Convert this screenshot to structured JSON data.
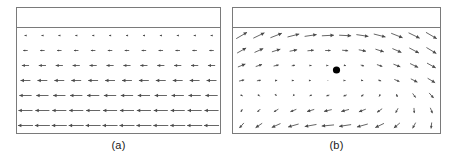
{
  "figure": {
    "background_color": "#ffffff",
    "border_color": "#7a7a7a",
    "arrow_color": "#4a4a4a",
    "marker_color": "#000000"
  },
  "panels": [
    {
      "id": "a",
      "caption": "(a)",
      "header_strip_height": 20,
      "marker": null
    },
    {
      "id": "b",
      "caption": "(b)",
      "header_strip_height": 20,
      "marker": {
        "x": 0.5,
        "y": 0.4,
        "radius": 3.6
      }
    }
  ],
  "chart_data": [
    {
      "type": "quiver",
      "panel": "a",
      "title": "(a)",
      "xlabel": "",
      "ylabel": "",
      "grid": false,
      "legend": null,
      "xlim": [
        0,
        12
      ],
      "ylim": [
        0,
        6
      ],
      "description": "Uniform leftward horizontal vector field; arrow magnitude increases monotonically from top row to bottom row.",
      "columns": 12,
      "rows": 7,
      "row_magnitudes": [
        0.12,
        0.3,
        0.48,
        0.66,
        0.82,
        0.94,
        1.0
      ],
      "row_angles_deg": [
        180,
        180,
        180,
        180,
        180,
        180,
        180
      ],
      "vectors": [
        {
          "x": 0,
          "y": 0,
          "u": -0.12,
          "v": 0
        },
        {
          "x": 1,
          "y": 0,
          "u": -0.12,
          "v": 0
        },
        {
          "x": 2,
          "y": 0,
          "u": -0.12,
          "v": 0
        },
        {
          "x": 3,
          "y": 0,
          "u": -0.12,
          "v": 0
        },
        {
          "x": 4,
          "y": 0,
          "u": -0.12,
          "v": 0
        },
        {
          "x": 5,
          "y": 0,
          "u": -0.12,
          "v": 0
        },
        {
          "x": 6,
          "y": 0,
          "u": -0.12,
          "v": 0
        },
        {
          "x": 7,
          "y": 0,
          "u": -0.12,
          "v": 0
        },
        {
          "x": 8,
          "y": 0,
          "u": -0.12,
          "v": 0
        },
        {
          "x": 9,
          "y": 0,
          "u": -0.12,
          "v": 0
        },
        {
          "x": 10,
          "y": 0,
          "u": -0.12,
          "v": 0
        },
        {
          "x": 11,
          "y": 0,
          "u": -0.12,
          "v": 0
        },
        {
          "x": 0,
          "y": 1,
          "u": -0.3,
          "v": 0
        },
        {
          "x": 1,
          "y": 1,
          "u": -0.3,
          "v": 0
        },
        {
          "x": 2,
          "y": 1,
          "u": -0.3,
          "v": 0
        },
        {
          "x": 3,
          "y": 1,
          "u": -0.3,
          "v": 0
        },
        {
          "x": 4,
          "y": 1,
          "u": -0.3,
          "v": 0
        },
        {
          "x": 5,
          "y": 1,
          "u": -0.3,
          "v": 0
        },
        {
          "x": 6,
          "y": 1,
          "u": -0.3,
          "v": 0
        },
        {
          "x": 7,
          "y": 1,
          "u": -0.3,
          "v": 0
        },
        {
          "x": 8,
          "y": 1,
          "u": -0.3,
          "v": 0
        },
        {
          "x": 9,
          "y": 1,
          "u": -0.3,
          "v": 0
        },
        {
          "x": 10,
          "y": 1,
          "u": -0.3,
          "v": 0
        },
        {
          "x": 11,
          "y": 1,
          "u": -0.3,
          "v": 0
        },
        {
          "x": 0,
          "y": 2,
          "u": -0.48,
          "v": 0
        },
        {
          "x": 1,
          "y": 2,
          "u": -0.48,
          "v": 0
        },
        {
          "x": 2,
          "y": 2,
          "u": -0.48,
          "v": 0
        },
        {
          "x": 3,
          "y": 2,
          "u": -0.48,
          "v": 0
        },
        {
          "x": 4,
          "y": 2,
          "u": -0.48,
          "v": 0
        },
        {
          "x": 5,
          "y": 2,
          "u": -0.48,
          "v": 0
        },
        {
          "x": 6,
          "y": 2,
          "u": -0.48,
          "v": 0
        },
        {
          "x": 7,
          "y": 2,
          "u": -0.48,
          "v": 0
        },
        {
          "x": 8,
          "y": 2,
          "u": -0.48,
          "v": 0
        },
        {
          "x": 9,
          "y": 2,
          "u": -0.48,
          "v": 0
        },
        {
          "x": 10,
          "y": 2,
          "u": -0.48,
          "v": 0
        },
        {
          "x": 11,
          "y": 2,
          "u": -0.48,
          "v": 0
        },
        {
          "x": 0,
          "y": 3,
          "u": -0.66,
          "v": 0
        },
        {
          "x": 1,
          "y": 3,
          "u": -0.66,
          "v": 0
        },
        {
          "x": 2,
          "y": 3,
          "u": -0.66,
          "v": 0
        },
        {
          "x": 3,
          "y": 3,
          "u": -0.66,
          "v": 0
        },
        {
          "x": 4,
          "y": 3,
          "u": -0.66,
          "v": 0
        },
        {
          "x": 5,
          "y": 3,
          "u": -0.66,
          "v": 0
        },
        {
          "x": 6,
          "y": 3,
          "u": -0.66,
          "v": 0
        },
        {
          "x": 7,
          "y": 3,
          "u": -0.66,
          "v": 0
        },
        {
          "x": 8,
          "y": 3,
          "u": -0.66,
          "v": 0
        },
        {
          "x": 9,
          "y": 3,
          "u": -0.66,
          "v": 0
        },
        {
          "x": 10,
          "y": 3,
          "u": -0.66,
          "v": 0
        },
        {
          "x": 11,
          "y": 3,
          "u": -0.66,
          "v": 0
        },
        {
          "x": 0,
          "y": 4,
          "u": -0.82,
          "v": 0
        },
        {
          "x": 1,
          "y": 4,
          "u": -0.82,
          "v": 0
        },
        {
          "x": 2,
          "y": 4,
          "u": -0.82,
          "v": 0
        },
        {
          "x": 3,
          "y": 4,
          "u": -0.82,
          "v": 0
        },
        {
          "x": 4,
          "y": 4,
          "u": -0.82,
          "v": 0
        },
        {
          "x": 5,
          "y": 4,
          "u": -0.82,
          "v": 0
        },
        {
          "x": 6,
          "y": 4,
          "u": -0.82,
          "v": 0
        },
        {
          "x": 7,
          "y": 4,
          "u": -0.82,
          "v": 0
        },
        {
          "x": 8,
          "y": 4,
          "u": -0.82,
          "v": 0
        },
        {
          "x": 9,
          "y": 4,
          "u": -0.82,
          "v": 0
        },
        {
          "x": 10,
          "y": 4,
          "u": -0.82,
          "v": 0
        },
        {
          "x": 11,
          "y": 4,
          "u": -0.82,
          "v": 0
        },
        {
          "x": 0,
          "y": 5,
          "u": -0.94,
          "v": 0
        },
        {
          "x": 1,
          "y": 5,
          "u": -0.94,
          "v": 0
        },
        {
          "x": 2,
          "y": 5,
          "u": -0.94,
          "v": 0
        },
        {
          "x": 3,
          "y": 5,
          "u": -0.94,
          "v": 0
        },
        {
          "x": 4,
          "y": 5,
          "u": -0.94,
          "v": 0
        },
        {
          "x": 5,
          "y": 5,
          "u": -0.94,
          "v": 0
        },
        {
          "x": 6,
          "y": 5,
          "u": -0.94,
          "v": 0
        },
        {
          "x": 7,
          "y": 5,
          "u": -0.94,
          "v": 0
        },
        {
          "x": 8,
          "y": 5,
          "u": -0.94,
          "v": 0
        },
        {
          "x": 9,
          "y": 5,
          "u": -0.94,
          "v": 0
        },
        {
          "x": 10,
          "y": 5,
          "u": -0.94,
          "v": 0
        },
        {
          "x": 11,
          "y": 5,
          "u": -0.94,
          "v": 0
        },
        {
          "x": 0,
          "y": 6,
          "u": -1.0,
          "v": 0
        },
        {
          "x": 1,
          "y": 6,
          "u": -1.0,
          "v": 0
        },
        {
          "x": 2,
          "y": 6,
          "u": -1.0,
          "v": 0
        },
        {
          "x": 3,
          "y": 6,
          "u": -1.0,
          "v": 0
        },
        {
          "x": 4,
          "y": 6,
          "u": -1.0,
          "v": 0
        },
        {
          "x": 5,
          "y": 6,
          "u": -1.0,
          "v": 0
        },
        {
          "x": 6,
          "y": 6,
          "u": -1.0,
          "v": 0
        },
        {
          "x": 7,
          "y": 6,
          "u": -1.0,
          "v": 0
        },
        {
          "x": 8,
          "y": 6,
          "u": -1.0,
          "v": 0
        },
        {
          "x": 9,
          "y": 6,
          "u": -1.0,
          "v": 0
        },
        {
          "x": 10,
          "y": 6,
          "u": -1.0,
          "v": 0
        },
        {
          "x": 11,
          "y": 6,
          "u": -1.0,
          "v": 0
        }
      ]
    },
    {
      "type": "quiver",
      "panel": "b",
      "title": "(b)",
      "xlabel": "",
      "ylabel": "",
      "grid": false,
      "legend": null,
      "xlim": [
        0,
        12
      ],
      "ylim": [
        0,
        6
      ],
      "description": "Circulating (vortex-like) vector field about a marked singular point; arrows point right/up-right in the upper half and left/down-left in the lower half, with magnitude vanishing near the central marker.",
      "columns": 12,
      "rows": 7,
      "center_index": {
        "col": 5.5,
        "row": 2.6
      },
      "marker_label": "singular-point",
      "vectors": [
        {
          "x": 0,
          "y": 0,
          "u": 0.72,
          "v": 0.42
        },
        {
          "x": 1,
          "y": 0,
          "u": 0.74,
          "v": 0.36
        },
        {
          "x": 2,
          "y": 0,
          "u": 0.76,
          "v": 0.3
        },
        {
          "x": 3,
          "y": 0,
          "u": 0.78,
          "v": 0.2
        },
        {
          "x": 4,
          "y": 0,
          "u": 0.8,
          "v": 0.12
        },
        {
          "x": 5,
          "y": 0,
          "u": 0.8,
          "v": 0.04
        },
        {
          "x": 6,
          "y": 0,
          "u": 0.8,
          "v": -0.04
        },
        {
          "x": 7,
          "y": 0,
          "u": 0.8,
          "v": -0.12
        },
        {
          "x": 8,
          "y": 0,
          "u": 0.78,
          "v": -0.2
        },
        {
          "x": 9,
          "y": 0,
          "u": 0.76,
          "v": -0.3
        },
        {
          "x": 10,
          "y": 0,
          "u": 0.74,
          "v": -0.36
        },
        {
          "x": 11,
          "y": 0,
          "u": 0.72,
          "v": -0.42
        },
        {
          "x": 0,
          "y": 1,
          "u": 0.6,
          "v": 0.34
        },
        {
          "x": 1,
          "y": 1,
          "u": 0.58,
          "v": 0.26
        },
        {
          "x": 2,
          "y": 1,
          "u": 0.56,
          "v": 0.18
        },
        {
          "x": 3,
          "y": 1,
          "u": 0.5,
          "v": 0.1
        },
        {
          "x": 4,
          "y": 1,
          "u": 0.42,
          "v": 0.04
        },
        {
          "x": 5,
          "y": 1,
          "u": 0.36,
          "v": 0.0
        },
        {
          "x": 6,
          "y": 1,
          "u": 0.4,
          "v": -0.04
        },
        {
          "x": 7,
          "y": 1,
          "u": 0.48,
          "v": -0.1
        },
        {
          "x": 8,
          "y": 1,
          "u": 0.56,
          "v": -0.18
        },
        {
          "x": 9,
          "y": 1,
          "u": 0.6,
          "v": -0.26
        },
        {
          "x": 10,
          "y": 1,
          "u": 0.64,
          "v": -0.34
        },
        {
          "x": 11,
          "y": 1,
          "u": 0.66,
          "v": -0.4
        },
        {
          "x": 0,
          "y": 2,
          "u": 0.5,
          "v": 0.2
        },
        {
          "x": 1,
          "y": 2,
          "u": 0.42,
          "v": 0.14
        },
        {
          "x": 2,
          "y": 2,
          "u": 0.34,
          "v": 0.08
        },
        {
          "x": 3,
          "y": 2,
          "u": 0.22,
          "v": 0.04
        },
        {
          "x": 4,
          "y": 2,
          "u": 0.12,
          "v": 0.0
        },
        {
          "x": 5,
          "y": 2,
          "u": 0.06,
          "v": 0.0
        },
        {
          "x": 6,
          "y": 2,
          "u": 0.1,
          "v": -0.02
        },
        {
          "x": 7,
          "y": 2,
          "u": 0.22,
          "v": -0.06
        },
        {
          "x": 8,
          "y": 2,
          "u": 0.36,
          "v": -0.12
        },
        {
          "x": 9,
          "y": 2,
          "u": 0.46,
          "v": -0.18
        },
        {
          "x": 10,
          "y": 2,
          "u": 0.54,
          "v": -0.26
        },
        {
          "x": 11,
          "y": 2,
          "u": 0.58,
          "v": -0.32
        },
        {
          "x": 0,
          "y": 3,
          "u": 0.34,
          "v": 0.08
        },
        {
          "x": 1,
          "y": 3,
          "u": 0.26,
          "v": 0.04
        },
        {
          "x": 2,
          "y": 3,
          "u": 0.14,
          "v": 0.02
        },
        {
          "x": 3,
          "y": 3,
          "u": 0.06,
          "v": 0.0
        },
        {
          "x": 4,
          "y": 3,
          "u": 0.04,
          "v": 0.0
        },
        {
          "x": 5,
          "y": 3,
          "u": 0.03,
          "v": 0.0
        },
        {
          "x": 6,
          "y": 3,
          "u": 0.05,
          "v": 0.0
        },
        {
          "x": 7,
          "y": 3,
          "u": 0.1,
          "v": -0.02
        },
        {
          "x": 8,
          "y": 3,
          "u": 0.2,
          "v": -0.06
        },
        {
          "x": 9,
          "y": 3,
          "u": 0.34,
          "v": -0.14
        },
        {
          "x": 10,
          "y": 3,
          "u": 0.44,
          "v": -0.22
        },
        {
          "x": 11,
          "y": 3,
          "u": 0.5,
          "v": -0.3
        },
        {
          "x": 0,
          "y": 4,
          "u": 0.14,
          "v": -0.06
        },
        {
          "x": 1,
          "y": 4,
          "u": 0.1,
          "v": -0.1
        },
        {
          "x": 2,
          "y": 4,
          "u": 0.04,
          "v": -0.06
        },
        {
          "x": 3,
          "y": 4,
          "u": -0.06,
          "v": -0.06
        },
        {
          "x": 4,
          "y": 4,
          "u": -0.14,
          "v": -0.06
        },
        {
          "x": 5,
          "y": 4,
          "u": -0.2,
          "v": -0.06
        },
        {
          "x": 6,
          "y": 4,
          "u": -0.22,
          "v": -0.08
        },
        {
          "x": 7,
          "y": 4,
          "u": -0.18,
          "v": -0.1
        },
        {
          "x": 8,
          "y": 4,
          "u": -0.08,
          "v": -0.14
        },
        {
          "x": 9,
          "y": 4,
          "u": 0.06,
          "v": -0.2
        },
        {
          "x": 10,
          "y": 4,
          "u": 0.2,
          "v": -0.28
        },
        {
          "x": 11,
          "y": 4,
          "u": 0.3,
          "v": -0.34
        },
        {
          "x": 0,
          "y": 5,
          "u": -0.1,
          "v": -0.2
        },
        {
          "x": 1,
          "y": 5,
          "u": -0.2,
          "v": -0.2
        },
        {
          "x": 2,
          "y": 5,
          "u": -0.3,
          "v": -0.18
        },
        {
          "x": 3,
          "y": 5,
          "u": -0.4,
          "v": -0.16
        },
        {
          "x": 4,
          "y": 5,
          "u": -0.48,
          "v": -0.14
        },
        {
          "x": 5,
          "y": 5,
          "u": -0.52,
          "v": -0.12
        },
        {
          "x": 6,
          "y": 5,
          "u": -0.52,
          "v": -0.14
        },
        {
          "x": 7,
          "y": 5,
          "u": -0.46,
          "v": -0.18
        },
        {
          "x": 8,
          "y": 5,
          "u": -0.34,
          "v": -0.24
        },
        {
          "x": 9,
          "y": 5,
          "u": -0.16,
          "v": -0.3
        },
        {
          "x": 10,
          "y": 5,
          "u": 0.02,
          "v": -0.34
        },
        {
          "x": 11,
          "y": 5,
          "u": 0.14,
          "v": -0.36
        },
        {
          "x": 0,
          "y": 6,
          "u": -0.3,
          "v": -0.34
        },
        {
          "x": 1,
          "y": 6,
          "u": -0.44,
          "v": -0.3
        },
        {
          "x": 2,
          "y": 6,
          "u": -0.58,
          "v": -0.26
        },
        {
          "x": 3,
          "y": 6,
          "u": -0.7,
          "v": -0.2
        },
        {
          "x": 4,
          "y": 6,
          "u": -0.78,
          "v": -0.14
        },
        {
          "x": 5,
          "y": 6,
          "u": -0.82,
          "v": -0.08
        },
        {
          "x": 6,
          "y": 6,
          "u": -0.8,
          "v": -0.12
        },
        {
          "x": 7,
          "y": 6,
          "u": -0.72,
          "v": -0.2
        },
        {
          "x": 8,
          "y": 6,
          "u": -0.58,
          "v": -0.28
        },
        {
          "x": 9,
          "y": 6,
          "u": -0.4,
          "v": -0.34
        },
        {
          "x": 10,
          "y": 6,
          "u": -0.2,
          "v": -0.38
        },
        {
          "x": 11,
          "y": 6,
          "u": -0.04,
          "v": -0.4
        }
      ]
    }
  ]
}
